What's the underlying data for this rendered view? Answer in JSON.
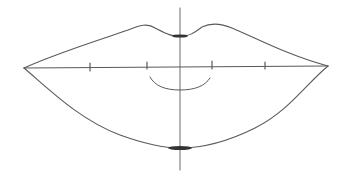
{
  "image": {
    "subject": "pencil sketch of lips with construction guide lines",
    "stroke_color": "#555555",
    "background": "#ffffff"
  },
  "guides": {
    "vertical_center_x": 180,
    "horizontal_mouth_line_y": 67,
    "tick_marks_x": [
      90,
      147,
      212,
      265
    ]
  }
}
